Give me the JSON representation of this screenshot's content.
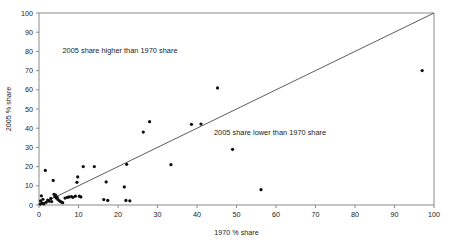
{
  "chart_data": {
    "type": "scatter",
    "title": "",
    "xlabel": "1970 % share",
    "ylabel": "2005 % share",
    "xlim": [
      0,
      100
    ],
    "ylim": [
      0,
      100
    ],
    "xticks": [
      0,
      10,
      20,
      30,
      40,
      50,
      60,
      70,
      80,
      90,
      100
    ],
    "yticks": [
      0,
      10,
      20,
      30,
      40,
      50,
      60,
      70,
      80,
      90,
      100
    ],
    "grid": false,
    "legend": null,
    "marker_color": "#0d0d0d",
    "reference_line": {
      "label": "y = x",
      "from": [
        0,
        0
      ],
      "to": [
        100,
        100
      ],
      "color": "#4a4a4a"
    },
    "annotations": [
      {
        "text": "2005 share higher than 1970 share",
        "x": 20.5,
        "y": 79.0
      },
      {
        "text": "2005 share lower than 1970 share",
        "x": 58.5,
        "y": 36.5
      }
    ],
    "points": [
      [
        0.3,
        0.5
      ],
      [
        0.4,
        2.2
      ],
      [
        0.6,
        4.8
      ],
      [
        0.8,
        1.0
      ],
      [
        1.0,
        3.0
      ],
      [
        1.2,
        0.6
      ],
      [
        1.6,
        18.0
      ],
      [
        1.8,
        1.4
      ],
      [
        2.2,
        2.6
      ],
      [
        2.6,
        2.0
      ],
      [
        3.0,
        3.4
      ],
      [
        3.2,
        1.8
      ],
      [
        3.6,
        12.8
      ],
      [
        3.8,
        5.6
      ],
      [
        4.0,
        4.4
      ],
      [
        4.2,
        5.2
      ],
      [
        4.4,
        3.6
      ],
      [
        4.6,
        4.0
      ],
      [
        4.8,
        2.8
      ],
      [
        5.2,
        2.2
      ],
      [
        5.6,
        1.6
      ],
      [
        6.0,
        1.2
      ],
      [
        6.6,
        3.6
      ],
      [
        7.2,
        4.0
      ],
      [
        7.6,
        4.2
      ],
      [
        8.2,
        4.4
      ],
      [
        8.6,
        4.0
      ],
      [
        9.2,
        4.6
      ],
      [
        9.6,
        11.8
      ],
      [
        9.8,
        14.6
      ],
      [
        10.2,
        4.6
      ],
      [
        10.6,
        4.2
      ],
      [
        11.2,
        20.0
      ],
      [
        14.0,
        20.0
      ],
      [
        16.4,
        2.8
      ],
      [
        17.0,
        12.0
      ],
      [
        17.4,
        2.4
      ],
      [
        21.6,
        9.4
      ],
      [
        22.0,
        2.4
      ],
      [
        22.2,
        21.2
      ],
      [
        23.0,
        2.2
      ],
      [
        26.4,
        38.0
      ],
      [
        28.0,
        43.4
      ],
      [
        33.4,
        21.0
      ],
      [
        38.6,
        42.0
      ],
      [
        41.0,
        42.2
      ],
      [
        45.2,
        61.0
      ],
      [
        49.0,
        29.0
      ],
      [
        56.2,
        8.0
      ],
      [
        97.0,
        70.0
      ]
    ]
  }
}
